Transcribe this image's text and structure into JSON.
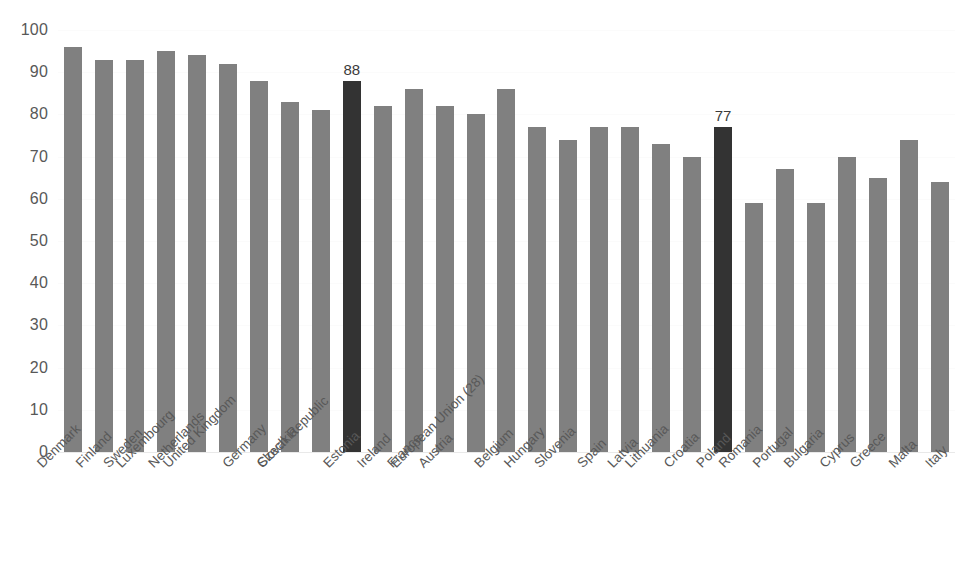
{
  "chart_data": {
    "type": "bar",
    "title": "",
    "subtitle": "",
    "xlabel": "",
    "ylabel": "",
    "ylim": [
      0,
      100
    ],
    "y_ticks": [
      0,
      10,
      20,
      30,
      40,
      50,
      60,
      70,
      80,
      90,
      100
    ],
    "grid": true,
    "legend": "none",
    "bar_color": "#808080",
    "highlight_color": "#333333",
    "highlighted_categories": [
      "Estonia",
      "Poland"
    ],
    "data_labels": {
      "Estonia": "88",
      "Poland": "77"
    },
    "categories": [
      "Denmark",
      "Finland",
      "Sweden",
      "Luxembourg",
      "Netherlands",
      "United Kingdom",
      "Germany",
      "Slovakia",
      "Czech Republic",
      "Estonia",
      "Ireland",
      "France",
      "Austria",
      "European Union (28)",
      "Belgium",
      "Hungary",
      "Slovenia",
      "Spain",
      "Latvia",
      "Lithuania",
      "Croatia",
      "Poland",
      "Romania",
      "Portugal",
      "Bulgaria",
      "Cyprus",
      "Greece",
      "Malta",
      "Italy"
    ],
    "values": [
      96,
      93,
      93,
      95,
      94,
      92,
      88,
      83,
      81,
      88,
      82,
      86,
      82,
      80,
      86,
      77,
      74,
      77,
      77,
      73,
      70,
      77,
      59,
      67,
      59,
      70,
      65,
      74,
      64
    ]
  }
}
